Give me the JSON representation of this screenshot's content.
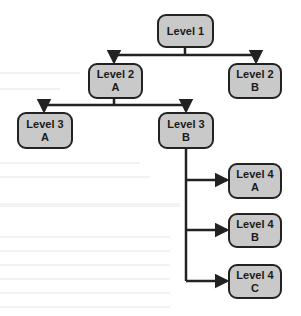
{
  "diagram": {
    "type": "hierarchy-tree",
    "colors": {
      "node_fill": "#c9c9c9",
      "node_border": "#222222",
      "connector": "#222222",
      "background": "#ffffff"
    },
    "nodes": [
      {
        "id": "level1",
        "line1": "Level 1",
        "line2": "",
        "x": 157,
        "y": 14,
        "w": 57,
        "h": 34
      },
      {
        "id": "level2a",
        "line1": "Level 2",
        "line2": "A",
        "x": 88,
        "y": 63,
        "w": 55,
        "h": 36
      },
      {
        "id": "level2b",
        "line1": "Level 2",
        "line2": "B",
        "x": 228,
        "y": 63,
        "w": 54,
        "h": 36
      },
      {
        "id": "level3a",
        "line1": "Level 3",
        "line2": "A",
        "x": 17,
        "y": 112,
        "w": 56,
        "h": 37
      },
      {
        "id": "level3b",
        "line1": "Level 3",
        "line2": "B",
        "x": 158,
        "y": 112,
        "w": 56,
        "h": 37
      },
      {
        "id": "level4a",
        "line1": "Level 4",
        "line2": "A",
        "x": 228,
        "y": 163,
        "w": 54,
        "h": 36
      },
      {
        "id": "level4b",
        "line1": "Level 4",
        "line2": "B",
        "x": 228,
        "y": 213,
        "w": 54,
        "h": 35
      },
      {
        "id": "level4c",
        "line1": "Level 4",
        "line2": "C",
        "x": 228,
        "y": 264,
        "w": 54,
        "h": 35
      }
    ],
    "edges": [
      [
        "level1",
        "level2a"
      ],
      [
        "level1",
        "level2b"
      ],
      [
        "level2a",
        "level3a"
      ],
      [
        "level2a",
        "level3b"
      ],
      [
        "level3b",
        "level4a"
      ],
      [
        "level3b",
        "level4b"
      ],
      [
        "level3b",
        "level4c"
      ]
    ]
  }
}
